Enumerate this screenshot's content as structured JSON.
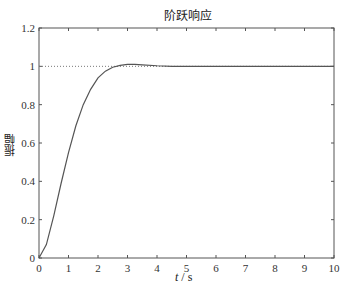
{
  "chart_data": {
    "type": "line",
    "title": "阶跃响应",
    "xlabel": "t / s",
    "ylabel": "振幅",
    "xlim": [
      0,
      10
    ],
    "ylim": [
      0,
      1.2
    ],
    "xticks": [
      "0",
      "1",
      "2",
      "3",
      "4",
      "5",
      "6",
      "7",
      "8",
      "9",
      "10"
    ],
    "yticks": [
      "0",
      "0.2",
      "0.4",
      "0.6",
      "0.8",
      "1",
      "1.2"
    ],
    "grid": false,
    "reference_line": {
      "y": 1,
      "style": "dotted"
    },
    "series": [
      {
        "name": "step response",
        "x": [
          0,
          0.25,
          0.5,
          0.75,
          1.0,
          1.25,
          1.5,
          1.75,
          2.0,
          2.25,
          2.5,
          2.75,
          3.0,
          3.25,
          3.5,
          4.0,
          4.5,
          5,
          6,
          7,
          8,
          9,
          10
        ],
        "y": [
          0,
          0.07,
          0.22,
          0.39,
          0.55,
          0.69,
          0.8,
          0.88,
          0.94,
          0.975,
          0.995,
          1.005,
          1.01,
          1.01,
          1.008,
          1.003,
          1.0,
          1.0,
          1.0,
          1.0,
          1.0,
          1.0,
          1.0
        ]
      }
    ]
  }
}
